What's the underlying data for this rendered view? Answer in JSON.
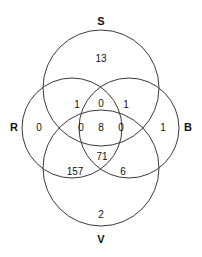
{
  "chart_data": {
    "type": "venn",
    "title": "",
    "subtitle": "",
    "xlabel": "",
    "ylabel": "",
    "legend_position": "none",
    "grid": false,
    "set_count": 4,
    "stroke_color": "#3a3a3a",
    "text_color": "#111111",
    "background_color": "#ffffff",
    "sets": [
      {
        "id": "S",
        "label": "S",
        "label_x": 101,
        "label_y": 22,
        "cx": 101,
        "cy": 88,
        "r": 58
      },
      {
        "id": "R",
        "label": "R",
        "label_x": 14,
        "label_y": 128,
        "cx": 72,
        "cy": 128,
        "r": 50
      },
      {
        "id": "B",
        "label": "B",
        "label_x": 188,
        "label_y": 128,
        "cx": 129,
        "cy": 128,
        "r": 50
      },
      {
        "id": "V",
        "label": "V",
        "label_x": 101,
        "label_y": 240,
        "cx": 101,
        "cy": 168,
        "r": 58
      }
    ],
    "regions": [
      {
        "id": "S-only",
        "sets": [
          "S"
        ],
        "value": "13",
        "x": 101,
        "y": 59
      },
      {
        "id": "R-only",
        "sets": [
          "R"
        ],
        "value": "0",
        "x": 39,
        "y": 128
      },
      {
        "id": "B-only",
        "sets": [
          "B"
        ],
        "value": "1",
        "x": 163,
        "y": 128
      },
      {
        "id": "V-only",
        "sets": [
          "V"
        ],
        "value": "2",
        "x": 101,
        "y": 215
      },
      {
        "id": "S-R",
        "sets": [
          "S",
          "R"
        ],
        "value": "1",
        "x": 77,
        "y": 105
      },
      {
        "id": "S-B",
        "sets": [
          "S",
          "B"
        ],
        "value": "1",
        "x": 126,
        "y": 105
      },
      {
        "id": "S-R-B",
        "sets": [
          "S",
          "R",
          "B"
        ],
        "value": "0",
        "x": 101,
        "y": 104
      },
      {
        "id": "S-R-V",
        "sets": [
          "S",
          "R",
          "V"
        ],
        "value": "0",
        "x": 81,
        "y": 128
      },
      {
        "id": "S-R-B-V",
        "sets": [
          "S",
          "R",
          "B",
          "V"
        ],
        "value": "8",
        "x": 101,
        "y": 128
      },
      {
        "id": "S-B-V",
        "sets": [
          "S",
          "B",
          "V"
        ],
        "value": "0",
        "x": 121,
        "y": 128
      },
      {
        "id": "S-V",
        "sets": [
          "S",
          "V"
        ],
        "value": "71",
        "x": 102,
        "y": 157
      },
      {
        "id": "R-V",
        "sets": [
          "R",
          "V"
        ],
        "value": "157",
        "x": 75,
        "y": 172
      },
      {
        "id": "B-V",
        "sets": [
          "B",
          "V"
        ],
        "value": "6",
        "x": 123,
        "y": 172
      }
    ]
  }
}
